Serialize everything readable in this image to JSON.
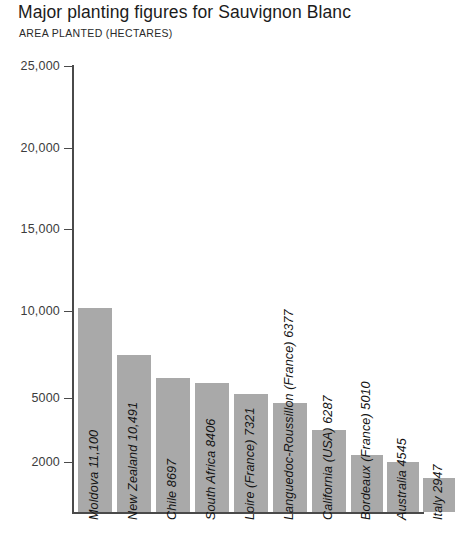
{
  "chart_data": {
    "type": "bar",
    "title": "Major planting figures for Sauvignon Blanc",
    "subtitle": "AREA PLANTED (HECTARES)",
    "xlabel": "",
    "ylabel": "AREA PLANTED (HECTARES)",
    "ylim": [
      0,
      25000
    ],
    "grid": false,
    "legend": false,
    "bar_color": "#a9a9a9",
    "axis_color": "#4a4a4a",
    "y_ticks": [
      {
        "label": "25,000",
        "value": 25000,
        "y": 66
      },
      {
        "label": "20,000",
        "value": 20000,
        "y": 148
      },
      {
        "label": "15,000",
        "value": 15000,
        "y": 229
      },
      {
        "label": "10,000",
        "value": 10000,
        "y": 311
      },
      {
        "label": "5000",
        "value": 5000,
        "y": 398
      },
      {
        "label": "2000",
        "value": 2000,
        "y": 462
      }
    ],
    "categories": [
      "Moldova",
      "New Zealand",
      "Chile",
      "South Africa",
      "Loire (France)",
      "Languedoc-Roussillon (France)",
      "California (USA)",
      "Bordeaux (France)",
      "Australia",
      "Italy"
    ],
    "values": [
      11100,
      10491,
      8697,
      8406,
      7321,
      6377,
      6287,
      5010,
      4545,
      2947
    ],
    "bars": [
      {
        "label": "Moldova 11,100",
        "name": "Moldova",
        "value": 11100,
        "value_text": "11,100",
        "x": 78,
        "width": 34,
        "top": 308
      },
      {
        "label": "New Zealand 10,491",
        "name": "New Zealand",
        "value": 10491,
        "value_text": "10,491",
        "x": 117,
        "width": 34,
        "top": 355
      },
      {
        "label": "Chile 8697",
        "name": "Chile",
        "value": 8697,
        "value_text": "8697",
        "x": 156,
        "width": 34,
        "top": 378
      },
      {
        "label": "South Africa 8406",
        "name": "South Africa",
        "value": 8406,
        "value_text": "8406",
        "x": 195,
        "width": 34,
        "top": 383
      },
      {
        "label": "Loire (France) 7321",
        "name": "Loire (France)",
        "value": 7321,
        "value_text": "7321",
        "x": 234,
        "width": 34,
        "top": 394
      },
      {
        "label": "Languedoc-Roussillon (France) 6377",
        "name": "Languedoc-Roussillon (France)",
        "value": 6377,
        "value_text": "6377",
        "x": 273,
        "width": 34,
        "top": 403
      },
      {
        "label": "California (USA) 6287",
        "name": "California (USA)",
        "value": 6287,
        "value_text": "6287",
        "x": 312,
        "width": 34,
        "top": 430
      },
      {
        "label": "Bordeaux (France) 5010",
        "name": "Bordeaux (France)",
        "value": 5010,
        "value_text": "5010",
        "x": 351,
        "width": 32,
        "top": 455
      },
      {
        "label": "Australia 4545",
        "name": "Australia",
        "value": 4545,
        "value_text": "4545",
        "x": 387,
        "width": 32,
        "top": 462
      },
      {
        "label": "Italy 2947",
        "name": "Italy",
        "value": 2947,
        "value_text": "2947",
        "x": 423,
        "width": 32,
        "top": 478
      }
    ],
    "baseline_y": 512
  }
}
